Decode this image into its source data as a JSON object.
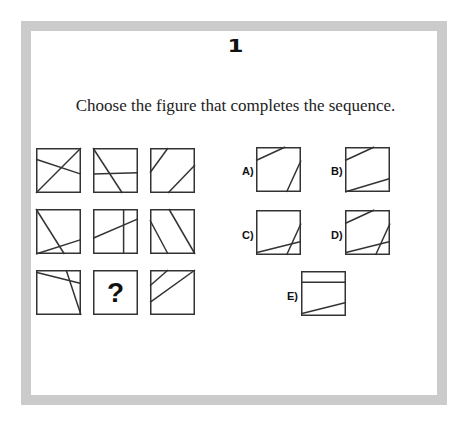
{
  "question": {
    "number": "1",
    "prompt": "Choose the figure that completes the sequence."
  },
  "colors": {
    "frame": "#cbcbcb",
    "stroke": "#333333",
    "background": "#ffffff"
  },
  "grid": [
    {
      "id": "cell-1",
      "x": 36,
      "y": 148,
      "lines": [
        [
          0,
          1,
          1,
          0
        ],
        [
          0,
          0.25,
          1,
          0.58
        ]
      ]
    },
    {
      "id": "cell-2",
      "x": 93,
      "y": 148,
      "lines": [
        [
          0,
          0,
          0.65,
          1
        ],
        [
          0,
          0.58,
          1,
          0.55
        ]
      ]
    },
    {
      "id": "cell-3",
      "x": 150,
      "y": 148,
      "lines": [
        [
          0.4,
          0,
          0,
          0.55
        ],
        [
          1,
          0.38,
          0.4,
          1
        ]
      ]
    },
    {
      "id": "cell-4",
      "x": 36,
      "y": 209,
      "lines": [
        [
          0,
          0,
          0.63,
          1
        ],
        [
          0,
          1,
          1,
          0.68
        ]
      ]
    },
    {
      "id": "cell-5",
      "x": 93,
      "y": 209,
      "lines": [
        [
          0.68,
          0,
          0.68,
          1
        ],
        [
          0,
          0.65,
          1,
          0.22
        ]
      ]
    },
    {
      "id": "cell-6",
      "x": 150,
      "y": 209,
      "lines": [
        [
          0.42,
          0,
          1,
          1
        ],
        [
          0,
          0.25,
          0.4,
          1
        ]
      ]
    },
    {
      "id": "cell-7",
      "x": 36,
      "y": 270,
      "lines": [
        [
          0,
          0.05,
          1,
          0.3
        ],
        [
          0.67,
          0,
          1,
          1
        ]
      ]
    },
    {
      "id": "cell-8",
      "x": 93,
      "y": 270,
      "missing": true,
      "symbol": "?"
    },
    {
      "id": "cell-9",
      "x": 150,
      "y": 270,
      "lines": [
        [
          0.4,
          0,
          0,
          0.35
        ],
        [
          1,
          0,
          0,
          0.72
        ]
      ]
    }
  ],
  "options": [
    {
      "label": "A)",
      "x": 256,
      "y": 147,
      "lx": 242,
      "ly": 165,
      "lines": [
        [
          0,
          0.3,
          0.65,
          0
        ],
        [
          1,
          0.3,
          0.68,
          1
        ]
      ]
    },
    {
      "label": "B)",
      "x": 345,
      "y": 147,
      "lx": 331,
      "ly": 165,
      "lines": [
        [
          0,
          0.3,
          0.65,
          0
        ],
        [
          0,
          1,
          1,
          0.7
        ]
      ]
    },
    {
      "label": "C)",
      "x": 256,
      "y": 210,
      "lx": 242,
      "ly": 229,
      "lines": [
        [
          0,
          0.95,
          1,
          0.7
        ],
        [
          1,
          0.3,
          0.68,
          1
        ]
      ]
    },
    {
      "label": "D)",
      "x": 345,
      "y": 210,
      "lx": 331,
      "ly": 229,
      "lines": [
        [
          0,
          0.3,
          0.65,
          0
        ],
        [
          0,
          0.95,
          1,
          0.7
        ],
        [
          1,
          0.3,
          0.68,
          1
        ]
      ]
    },
    {
      "label": "E)",
      "x": 301,
      "y": 271,
      "lx": 287,
      "ly": 290,
      "lines": [
        [
          0,
          0.25,
          1,
          0.25
        ],
        [
          0,
          0.95,
          1,
          0.7
        ]
      ]
    }
  ]
}
